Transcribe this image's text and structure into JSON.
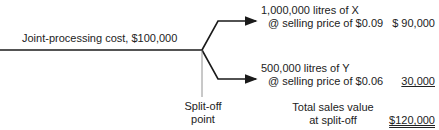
{
  "joint_cost_label": "Joint-processing cost, $100,000",
  "split_off_label": [
    "Split-off",
    "point"
  ],
  "products": [
    {
      "line1": "1,000,000 litres of X",
      "line2": "@ selling price of $0.09",
      "value": "$ 90,000"
    },
    {
      "line1": "500,000 litres of Y",
      "line2": "@ selling price of $0.06",
      "value": "30,000"
    }
  ],
  "total": {
    "line1": "Total sales value",
    "line2": "at split-off",
    "value": "$120,000"
  },
  "colors": {
    "line": "#1a1a1a",
    "text": "#222222"
  }
}
